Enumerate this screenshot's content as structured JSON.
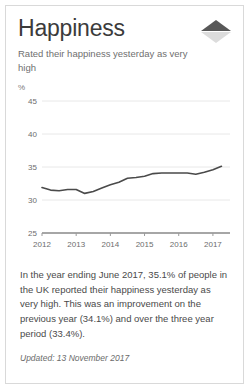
{
  "card": {
    "title": "Happiness",
    "subtitle": "Rated their happiness yesterday as very high",
    "indicator_icon": "triangle-up-icon",
    "indicator_direction": "up",
    "body": "In the year ending June 2017, 35.1% of people in the UK reported their happiness yesterday as very high. This was an improvement on the previous year (34.1%) and over the three year period (33.4%).",
    "updated": "Updated: 13 November 2017"
  },
  "colors": {
    "line": "#4a4a4a",
    "grid": "#e8e8e8",
    "axis": "#9a9a9a",
    "border": "#d9d9d9",
    "indicator_up": "#585858",
    "indicator_down": "#dcdcdc",
    "title_text": "#3b3b3b",
    "body_text": "#4a4a4a"
  },
  "chart_data": {
    "type": "line",
    "title": "",
    "xlabel": "",
    "ylabel": "%",
    "unit_label": "%",
    "ylim": [
      25,
      45
    ],
    "xlim": [
      2012,
      2017.5
    ],
    "grid": true,
    "grid_axis": "y",
    "legend": "none",
    "yticks": [
      25,
      30,
      35,
      40,
      45
    ],
    "ytick_labels": [
      "25",
      "30",
      "35",
      "40",
      "45"
    ],
    "xticks": [
      2012,
      2013,
      2014,
      2015,
      2016,
      2017
    ],
    "xtick_labels": [
      "2012",
      "2013",
      "2014",
      "2015",
      "2016",
      "2017"
    ],
    "series": [
      {
        "name": "Rated happiness yesterday as very high",
        "x": [
          2012.0,
          2012.25,
          2012.5,
          2012.75,
          2013.0,
          2013.25,
          2013.5,
          2013.75,
          2014.0,
          2014.25,
          2014.5,
          2014.75,
          2015.0,
          2015.25,
          2015.5,
          2015.75,
          2016.0,
          2016.25,
          2016.5,
          2016.75,
          2017.0,
          2017.25
        ],
        "values": [
          31.9,
          31.5,
          31.4,
          31.6,
          31.6,
          31.0,
          31.3,
          31.8,
          32.3,
          32.7,
          33.3,
          33.4,
          33.6,
          34.0,
          34.1,
          34.1,
          34.1,
          34.1,
          33.9,
          34.2,
          34.6,
          35.1
        ]
      }
    ],
    "annotations": {
      "latest_value": 35.1,
      "previous_year_value": 34.1,
      "three_year_value": 33.4
    }
  }
}
